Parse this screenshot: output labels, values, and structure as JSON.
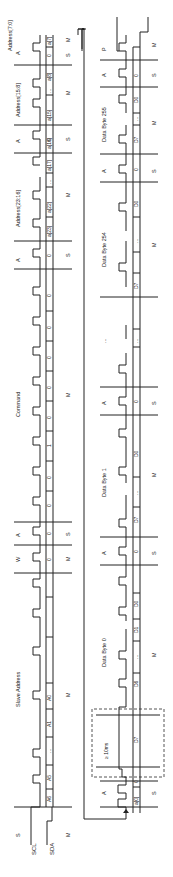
{
  "diagram": {
    "type": "I2C write timing diagram",
    "colors": {
      "line": "#222222",
      "dashed_box": "#555555",
      "background": "#ffffff"
    },
    "signals": {
      "scl": "SCL",
      "sda": "SDA"
    },
    "row1": {
      "start_label": "S",
      "fields": [
        {
          "title": "Slave Address",
          "bits": [
            "A6",
            "A5",
            "...",
            "A1",
            "A0"
          ],
          "driver": "M"
        },
        {
          "title": "W",
          "bits": [
            "0"
          ],
          "driver": "M"
        },
        {
          "title": "A",
          "bits": [
            "0"
          ],
          "driver": "S"
        },
        {
          "title": "Command",
          "bits": [
            "0",
            "0",
            "1",
            "0",
            "0",
            "0",
            "0",
            "0"
          ],
          "driver": "M"
        },
        {
          "title": "A",
          "bits": [
            "0"
          ],
          "driver": "S"
        },
        {
          "title": "Address[23:16]",
          "bits": [
            "a[23]",
            "a[22]",
            "...",
            "a[17]",
            "a[16]"
          ],
          "driver": "M"
        },
        {
          "title": "A",
          "bits": [
            "0"
          ],
          "driver": "S"
        },
        {
          "title": "Address[15:8]",
          "bits": [
            "a[15]",
            "...",
            "a[8]"
          ],
          "driver": "M"
        },
        {
          "title": "A",
          "bits": [
            "0"
          ],
          "driver": "S"
        },
        {
          "title": "Address[7:0]",
          "bits": [
            "a[7]",
            "..."
          ],
          "driver": "M"
        }
      ]
    },
    "row2": {
      "fields": [
        {
          "title": "",
          "bits": [
            "a[0]"
          ],
          "driver": ""
        },
        {
          "title": "A",
          "bits": [
            "0"
          ],
          "driver": "S"
        },
        {
          "title": "Data Byte 0",
          "bits": [
            "D7",
            "D6",
            "...",
            "D1",
            "D0"
          ],
          "driver": "M"
        },
        {
          "title": "A",
          "bits": [
            "0"
          ],
          "driver": "S"
        },
        {
          "title": "Data Byte 1",
          "bits": [
            "D7",
            "...",
            "D0"
          ],
          "driver": "M"
        },
        {
          "title": "A",
          "bits": [
            "0"
          ],
          "driver": "S"
        },
        {
          "title": "...",
          "bits": [
            "..."
          ],
          "driver": ""
        },
        {
          "title": "Data Byte 254",
          "bits": [
            "D7",
            "...",
            "D0"
          ],
          "driver": "M"
        },
        {
          "title": "A",
          "bits": [
            "0"
          ],
          "driver": "S"
        },
        {
          "title": "Data Byte 255",
          "bits": [
            "D7",
            "...",
            "D0"
          ],
          "driver": "M"
        },
        {
          "title": "A",
          "bits": [
            "0"
          ],
          "driver": "S"
        },
        {
          "title": "P",
          "bits": [],
          "driver": "M"
        }
      ],
      "wait_box_label": "≥ 10ms"
    },
    "labels": {
      "s": "S",
      "m": "M",
      "w": "W",
      "a": "A",
      "p": "P",
      "slave_address": "Slave Address",
      "command": "Command",
      "addr_23_16": "Address[23:16]",
      "addr_15_8": "Address[15:8]",
      "addr_7_0": "Address[7:0]",
      "data0": "Data Byte 0",
      "data1": "Data Byte 1",
      "data254": "Data Byte 254",
      "data255": "Data Byte 255",
      "wait": "≥ 10ms",
      "ellipsis": "...",
      "b_A6": "A6",
      "b_A5": "A5",
      "b_A1": "A1",
      "b_A0": "A0",
      "zero": "0",
      "one": "1",
      "a23": "a[23]",
      "a22": "a[22]",
      "a17": "a[17]",
      "a16": "a[16]",
      "a15": "a[15]",
      "a8": "a[8]",
      "a7": "a[7]",
      "a0": "a[0]",
      "D7": "D7",
      "D6": "D6",
      "D1": "D1",
      "D0": "D0"
    }
  }
}
